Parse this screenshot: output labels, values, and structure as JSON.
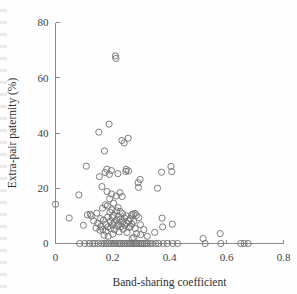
{
  "chart_data": {
    "type": "scatter",
    "title": "",
    "xlabel": "Band-sharing coefficient",
    "ylabel": "Extra-pair paternity (%)",
    "xlim": [
      0,
      0.8
    ],
    "ylim": [
      0,
      80
    ],
    "xticks": [
      0,
      0.2,
      0.4,
      0.6,
      0.8
    ],
    "xtick_labels": [
      "0",
      "0.2",
      "0.4",
      "0.6",
      "0.8"
    ],
    "yticks": [
      0,
      20,
      40,
      60,
      80
    ],
    "ytick_labels": [
      "0",
      "20",
      "40",
      "60",
      "80"
    ],
    "grid": false,
    "legend": null,
    "marker": "open-circle",
    "marker_color": "#6f6f6f",
    "marker_fill": "none",
    "axis_color": "#8a8a8a",
    "points": [
      [
        0.0,
        14.2
      ],
      [
        0.048,
        9.2
      ],
      [
        0.082,
        17.6
      ],
      [
        0.085,
        0.0
      ],
      [
        0.098,
        6.6
      ],
      [
        0.103,
        0.0
      ],
      [
        0.108,
        28.0
      ],
      [
        0.112,
        10.4
      ],
      [
        0.118,
        0.0
      ],
      [
        0.122,
        10.6
      ],
      [
        0.126,
        10.0
      ],
      [
        0.13,
        0.0
      ],
      [
        0.134,
        8.2
      ],
      [
        0.138,
        0.0
      ],
      [
        0.142,
        5.6
      ],
      [
        0.145,
        11.0
      ],
      [
        0.148,
        7.3
      ],
      [
        0.15,
        0.0
      ],
      [
        0.152,
        40.3
      ],
      [
        0.154,
        24.2
      ],
      [
        0.156,
        4.8
      ],
      [
        0.158,
        9.0
      ],
      [
        0.16,
        6.2
      ],
      [
        0.162,
        0.0
      ],
      [
        0.163,
        20.6
      ],
      [
        0.165,
        12.8
      ],
      [
        0.166,
        5.1
      ],
      [
        0.168,
        8.4
      ],
      [
        0.17,
        3.0
      ],
      [
        0.171,
        0.0
      ],
      [
        0.172,
        33.5
      ],
      [
        0.174,
        25.7
      ],
      [
        0.175,
        14.0
      ],
      [
        0.176,
        7.0
      ],
      [
        0.177,
        4.4
      ],
      [
        0.178,
        0.0
      ],
      [
        0.18,
        26.9
      ],
      [
        0.181,
        18.8
      ],
      [
        0.182,
        13.6
      ],
      [
        0.183,
        9.6
      ],
      [
        0.184,
        6.0
      ],
      [
        0.185,
        2.6
      ],
      [
        0.186,
        0.0
      ],
      [
        0.188,
        43.2
      ],
      [
        0.189,
        25.0
      ],
      [
        0.19,
        16.2
      ],
      [
        0.191,
        11.3
      ],
      [
        0.192,
        8.0
      ],
      [
        0.193,
        5.4
      ],
      [
        0.194,
        0.0
      ],
      [
        0.196,
        26.4
      ],
      [
        0.197,
        17.9
      ],
      [
        0.198,
        12.2
      ],
      [
        0.199,
        9.4
      ],
      [
        0.2,
        6.8
      ],
      [
        0.201,
        3.4
      ],
      [
        0.202,
        0.0
      ],
      [
        0.204,
        14.6
      ],
      [
        0.205,
        10.2
      ],
      [
        0.206,
        7.6
      ],
      [
        0.207,
        5.0
      ],
      [
        0.208,
        0.0
      ],
      [
        0.21,
        67.9
      ],
      [
        0.212,
        67.0
      ],
      [
        0.213,
        17.2
      ],
      [
        0.214,
        11.8
      ],
      [
        0.215,
        8.6
      ],
      [
        0.216,
        6.4
      ],
      [
        0.217,
        0.0
      ],
      [
        0.219,
        25.3
      ],
      [
        0.22,
        13.0
      ],
      [
        0.221,
        9.8
      ],
      [
        0.222,
        7.1
      ],
      [
        0.223,
        4.2
      ],
      [
        0.224,
        0.0
      ],
      [
        0.226,
        18.4
      ],
      [
        0.227,
        11.6
      ],
      [
        0.228,
        8.8
      ],
      [
        0.229,
        6.1
      ],
      [
        0.23,
        0.0
      ],
      [
        0.233,
        37.3
      ],
      [
        0.234,
        17.0
      ],
      [
        0.235,
        10.8
      ],
      [
        0.236,
        7.8
      ],
      [
        0.237,
        5.2
      ],
      [
        0.238,
        0.0
      ],
      [
        0.241,
        36.4
      ],
      [
        0.242,
        9.2
      ],
      [
        0.243,
        6.6
      ],
      [
        0.244,
        0.0
      ],
      [
        0.247,
        26.1
      ],
      [
        0.248,
        26.8
      ],
      [
        0.249,
        10.0
      ],
      [
        0.25,
        7.4
      ],
      [
        0.251,
        4.0
      ],
      [
        0.252,
        0.0
      ],
      [
        0.255,
        38.1
      ],
      [
        0.256,
        26.3
      ],
      [
        0.257,
        8.2
      ],
      [
        0.258,
        5.8
      ],
      [
        0.259,
        0.0
      ],
      [
        0.262,
        9.0
      ],
      [
        0.263,
        6.2
      ],
      [
        0.264,
        0.0
      ],
      [
        0.267,
        10.4
      ],
      [
        0.268,
        7.0
      ],
      [
        0.269,
        1.8
      ],
      [
        0.27,
        0.0
      ],
      [
        0.273,
        10.6
      ],
      [
        0.274,
        8.0
      ],
      [
        0.275,
        2.2
      ],
      [
        0.276,
        0.0
      ],
      [
        0.279,
        10.9
      ],
      [
        0.28,
        5.4
      ],
      [
        0.281,
        0.0
      ],
      [
        0.284,
        10.2
      ],
      [
        0.285,
        3.6
      ],
      [
        0.286,
        0.0
      ],
      [
        0.29,
        22.0
      ],
      [
        0.291,
        20.3
      ],
      [
        0.292,
        9.4
      ],
      [
        0.293,
        0.0
      ],
      [
        0.297,
        23.2
      ],
      [
        0.298,
        6.8
      ],
      [
        0.299,
        3.2
      ],
      [
        0.3,
        0.0
      ],
      [
        0.305,
        0.0
      ],
      [
        0.31,
        5.0
      ],
      [
        0.312,
        0.0
      ],
      [
        0.318,
        0.0
      ],
      [
        0.322,
        2.6
      ],
      [
        0.325,
        0.0
      ],
      [
        0.333,
        0.0
      ],
      [
        0.34,
        0.0
      ],
      [
        0.348,
        4.0
      ],
      [
        0.352,
        0.0
      ],
      [
        0.358,
        20.0
      ],
      [
        0.362,
        0.0
      ],
      [
        0.372,
        25.8
      ],
      [
        0.374,
        9.2
      ],
      [
        0.376,
        6.0
      ],
      [
        0.378,
        0.0
      ],
      [
        0.392,
        0.0
      ],
      [
        0.405,
        27.9
      ],
      [
        0.408,
        26.0
      ],
      [
        0.41,
        7.0
      ],
      [
        0.412,
        0.0
      ],
      [
        0.428,
        0.0
      ],
      [
        0.518,
        1.8
      ],
      [
        0.525,
        0.0
      ],
      [
        0.578,
        3.6
      ],
      [
        0.58,
        0.0
      ],
      [
        0.65,
        0.0
      ],
      [
        0.662,
        0.0
      ],
      [
        0.676,
        0.0
      ]
    ]
  },
  "figure": {
    "caption": ""
  }
}
